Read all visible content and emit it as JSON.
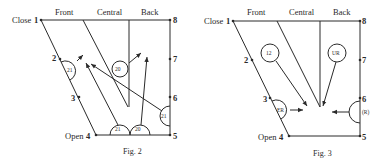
{
  "figures": [
    {
      "caption": "Fig. 2",
      "header": {
        "front": "Front",
        "central": "Central",
        "back": "Back"
      },
      "close_label": "Close",
      "open_label": "Open",
      "points": {
        "p1": "1",
        "p2": "2",
        "p3": "3",
        "p4": "4",
        "p5": "5",
        "p6": "6",
        "p7": "7",
        "p8": "8"
      },
      "symbols": {
        "left_half": "21",
        "center_circle": "20",
        "bottom_left_half": "21",
        "bottom_right_half": "20",
        "right_half": "21"
      }
    },
    {
      "caption": "Fig. 3",
      "header": {
        "front": "Front",
        "central": "Central",
        "back": "Back"
      },
      "close_label": "Close",
      "open_label": "Open",
      "points": {
        "p1": "1",
        "p2": "2",
        "p3": "3",
        "p4": "4",
        "p5": "5",
        "p6": "6",
        "p7": "7",
        "p8": "8"
      },
      "symbols": {
        "front_circle": "12",
        "back_circle": "UR",
        "left_half": "ER",
        "right_half": "(R)"
      }
    }
  ]
}
